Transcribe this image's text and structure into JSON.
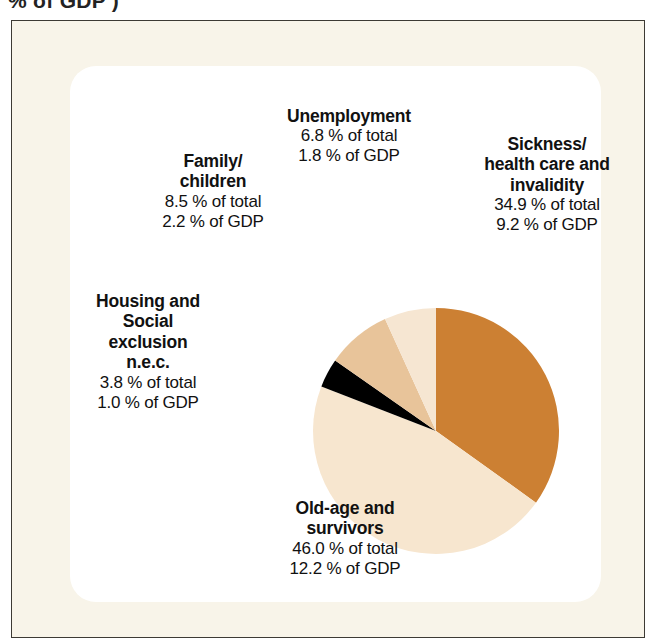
{
  "caption_fragment": "% of GDP )",
  "colors": {
    "page_background": "#ffffff",
    "frame_background": "#f8f4e9",
    "frame_border": "#3d3a34",
    "panel_background": "#ffffff",
    "text": "#111111",
    "slice_sickness": "#cc8033",
    "slice_oldage": "#f7e6cf",
    "slice_housing": "#000000",
    "slice_family": "#e8c49a",
    "slice_unemployment": "#f6e6d2"
  },
  "labels": {
    "unemployment": {
      "title": "Unemployment",
      "total": "6.8 % of total",
      "gdp": "1.8 % of GDP"
    },
    "sickness": {
      "title_line1": "Sickness/",
      "title_line2": "health care and",
      "title_line3": "invalidity",
      "total": "34.9 % of total",
      "gdp": "9.2 % of GDP"
    },
    "family": {
      "title_line1": "Family/",
      "title_line2": "children",
      "total": "8.5 % of total",
      "gdp": "2.2 % of GDP"
    },
    "housing": {
      "title_line1": "Housing and",
      "title_line2": "Social",
      "title_line3": "exclusion",
      "title_line4": "n.e.c.",
      "total": "3.8 % of total",
      "gdp": "1.0 % of GDP"
    },
    "oldage": {
      "title_line1": "Old-age and",
      "title_line2": "survivors",
      "total": "46.0 % of total",
      "gdp": "12.2 % of GDP"
    }
  },
  "chart_data": {
    "type": "pie",
    "title": "",
    "unit": "percent of total social protection expenditure",
    "start_angle_deg": 0,
    "direction": "clockwise",
    "legend_position": "around-slices",
    "categories": [
      "Sickness/health care and invalidity",
      "Old-age and survivors",
      "Housing and Social exclusion n.e.c.",
      "Family/children",
      "Unemployment"
    ],
    "values": [
      34.9,
      46.0,
      3.8,
      8.5,
      6.8
    ],
    "values_gdp": [
      9.2,
      12.2,
      1.0,
      2.2,
      1.8
    ],
    "colors": [
      "#cc8033",
      "#f7e6cf",
      "#000000",
      "#e8c49a",
      "#f6e6d2"
    ],
    "slices": [
      {
        "label": "Sickness/health care and invalidity",
        "percent_of_total": 34.9,
        "percent_of_gdp": 9.2,
        "color": "#cc8033"
      },
      {
        "label": "Old-age and survivors",
        "percent_of_total": 46.0,
        "percent_of_gdp": 12.2,
        "color": "#f7e6cf"
      },
      {
        "label": "Housing and Social exclusion n.e.c.",
        "percent_of_total": 3.8,
        "percent_of_gdp": 1.0,
        "color": "#000000"
      },
      {
        "label": "Family/children",
        "percent_of_total": 8.5,
        "percent_of_gdp": 2.2,
        "color": "#e8c49a"
      },
      {
        "label": "Unemployment",
        "percent_of_total": 6.8,
        "percent_of_gdp": 1.8,
        "color": "#f6e6d2"
      }
    ]
  }
}
